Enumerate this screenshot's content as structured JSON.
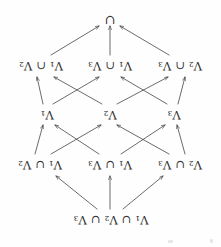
{
  "diagram": {
    "type": "lattice-hasse-diagram",
    "orientation_note": "rendered-upside-down",
    "background_color": "#fefefe",
    "ink_color": "#2e2e2e",
    "nodes": [
      {
        "id": "n_top",
        "row": 1,
        "x": 110,
        "y": 28,
        "prefix": "V",
        "sub1": "1",
        "op1": "∪",
        "mid": "V",
        "sub2": "2",
        "op2": "∪",
        "suffix": "V",
        "sub3": "3",
        "text": "V1 ∪ V2 ∪ V3"
      },
      {
        "id": "n_u23",
        "row": 2,
        "x": 41,
        "y": 83,
        "left": "V",
        "lsub": "2",
        "op": "∪",
        "right": "V",
        "rsub": "3",
        "text": "V2 ∪ V3"
      },
      {
        "id": "n_u13",
        "row": 2,
        "x": 111,
        "y": 83,
        "left": "V",
        "lsub": "1",
        "op": "∪",
        "right": "V",
        "rsub": "3",
        "text": "V1 ∪ V3"
      },
      {
        "id": "n_u12",
        "row": 2,
        "x": 181,
        "y": 83,
        "left": "V",
        "lsub": "1",
        "op": "∪",
        "right": "V",
        "rsub": "2",
        "text": "V1 ∪ V2"
      },
      {
        "id": "n_v3",
        "row": 3,
        "x": 47,
        "y": 133,
        "left": "V",
        "lsub": "3",
        "text": "V3"
      },
      {
        "id": "n_v2",
        "row": 3,
        "x": 111,
        "y": 133,
        "left": "V",
        "lsub": "2",
        "text": "V2"
      },
      {
        "id": "n_v1",
        "row": 3,
        "x": 174,
        "y": 133,
        "left": "V",
        "lsub": "1",
        "text": "V1"
      },
      {
        "id": "n_i23",
        "row": 4,
        "x": 41,
        "y": 182,
        "left": "V",
        "lsub": "2",
        "op": "∩",
        "right": "V",
        "rsub": "3",
        "text": "V2 ∩ V3"
      },
      {
        "id": "n_i13",
        "row": 4,
        "x": 111,
        "y": 182,
        "left": "V",
        "lsub": "1",
        "op": "∩",
        "right": "V",
        "rsub": "3",
        "text": "V1 ∩ V3"
      },
      {
        "id": "n_i12",
        "row": 4,
        "x": 180,
        "y": 182,
        "left": "V",
        "lsub": "1",
        "op": "∩",
        "right": "V",
        "rsub": "2",
        "text": "V1 ∩ V2"
      },
      {
        "id": "n_bottom",
        "row": 5,
        "x": 111,
        "y": 228,
        "symbol": "∪",
        "text": "∪"
      }
    ],
    "edges": [
      {
        "from": "n_top",
        "to": "n_u23"
      },
      {
        "from": "n_top",
        "to": "n_u13"
      },
      {
        "from": "n_top",
        "to": "n_u12"
      },
      {
        "from": "n_u23",
        "to": "n_v3"
      },
      {
        "from": "n_u23",
        "to": "n_v2"
      },
      {
        "from": "n_u13",
        "to": "n_v3"
      },
      {
        "from": "n_u13",
        "to": "n_v1"
      },
      {
        "from": "n_u12",
        "to": "n_v2"
      },
      {
        "from": "n_u12",
        "to": "n_v1"
      },
      {
        "from": "n_v3",
        "to": "n_i23"
      },
      {
        "from": "n_v3",
        "to": "n_i13"
      },
      {
        "from": "n_v2",
        "to": "n_i23"
      },
      {
        "from": "n_v2",
        "to": "n_i12"
      },
      {
        "from": "n_v1",
        "to": "n_i13"
      },
      {
        "from": "n_v1",
        "to": "n_i12"
      },
      {
        "from": "n_i23",
        "to": "n_bottom"
      },
      {
        "from": "n_i13",
        "to": "n_bottom"
      },
      {
        "from": "n_i12",
        "to": "n_bottom"
      }
    ]
  },
  "labels": {
    "top": "V₁ ∪ V₂ ∪ V₃",
    "union_23": "V₂ ∪ V₃",
    "union_13": "V₁ ∪ V₃",
    "union_12": "V₁ ∪ V₂",
    "v3": "V₃",
    "v2": "V₂",
    "v1": "V₁",
    "inter_23": "V₂ ∩ V₃",
    "inter_13": "V₁ ∩ V₃",
    "inter_12": "V₁ ∩ V₂",
    "bottom": "∪",
    "V": "V",
    "union_op": "∪",
    "inter_op": "∩",
    "sub1": "1",
    "sub2": "2",
    "sub3": "3"
  }
}
